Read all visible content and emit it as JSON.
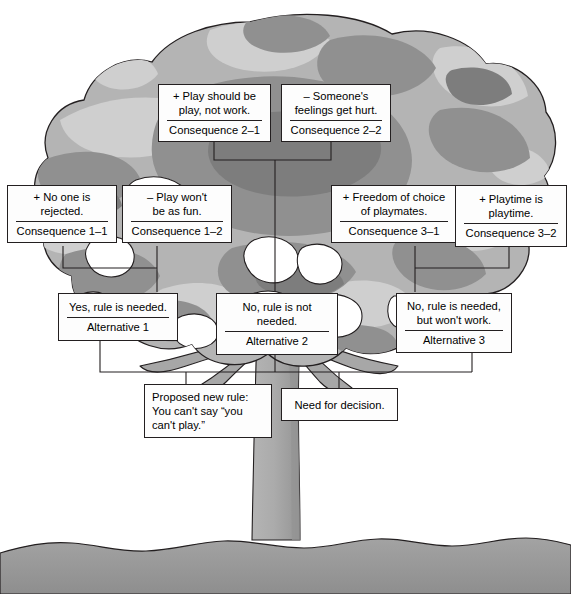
{
  "figure": {
    "kind": "decision-tree-diagram",
    "colors": {
      "box_fill": "#fdfdfd",
      "box_border": "#231f20",
      "connector": "#231f20",
      "foliage_light": "#c9c9c9",
      "foliage_mid": "#a6a6a6",
      "foliage_dark": "#8d8d8d",
      "foliage_darkest": "#7b7b7b",
      "trunk": "#a8a8a8",
      "trunk_shadow": "#8f8f8f",
      "ground": "#9a9a9a",
      "outline": "#231f20"
    }
  },
  "nodes": {
    "consequence_2_1": {
      "line1": "+ Play should be",
      "line2": "play, not work.",
      "label": "Consequence 2–1"
    },
    "consequence_2_2": {
      "line1": "– Someone's",
      "line2": "feelings get hurt.",
      "label": "Consequence 2–2"
    },
    "consequence_1_1": {
      "line1": "+ No one is",
      "line2": "rejected.",
      "label": "Consequence 1–1"
    },
    "consequence_1_2": {
      "line1": "– Play won't",
      "line2": "be as fun.",
      "label": "Consequence 1–2"
    },
    "consequence_3_1": {
      "line1": "+ Freedom of choice",
      "line2": "of playmates.",
      "label": "Consequence 3–1"
    },
    "consequence_3_2": {
      "line1": "+ Playtime is playtime.",
      "line2": "",
      "label": "Consequence 3–2"
    },
    "alternative_1": {
      "line1": "Yes, rule is needed.",
      "line2": "",
      "label": "Alternative 1"
    },
    "alternative_2": {
      "line1": "No, rule is not needed.",
      "line2": "",
      "label": "Alternative 2"
    },
    "alternative_3": {
      "line1": "No, rule is needed,",
      "line2": "but won't work.",
      "label": "Alternative 3"
    },
    "proposed_rule": {
      "line1": "Proposed new rule:",
      "line2": "You can't say “you",
      "line3": "can't play.”"
    },
    "need_for_decision": {
      "line1": "Need for decision."
    }
  }
}
